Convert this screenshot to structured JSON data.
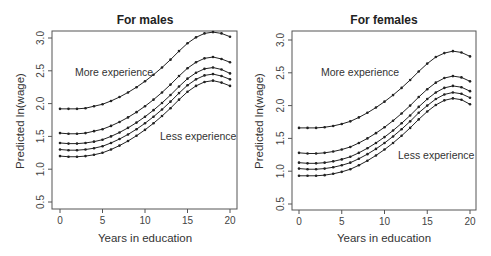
{
  "chart_data": [
    {
      "type": "line",
      "title": "For males",
      "xlabel": "Years in education",
      "ylabel": "Predicted ln(wage)",
      "xlim": [
        0,
        20
      ],
      "ylim": [
        0.5,
        3.0
      ],
      "xticks": [
        0,
        5,
        10,
        15,
        20
      ],
      "yticks": [
        0.5,
        1.0,
        1.5,
        2.0,
        2.5,
        3.0
      ],
      "grid": false,
      "x": [
        0,
        1,
        2,
        3,
        4,
        5,
        6,
        7,
        8,
        9,
        10,
        11,
        12,
        13,
        14,
        15,
        16,
        17,
        18,
        19,
        20
      ],
      "annotations": [
        {
          "text": "More experience",
          "x": 9,
          "y": 2.5
        },
        {
          "text": "Less experience",
          "x": 16.5,
          "y": 1.6
        }
      ],
      "series": [
        {
          "name": "Experience level 1 (most)",
          "values": [
            1.92,
            1.92,
            1.92,
            1.93,
            1.96,
            1.99,
            2.04,
            2.1,
            2.17,
            2.25,
            2.34,
            2.44,
            2.55,
            2.67,
            2.8,
            2.92,
            3.01,
            3.07,
            3.09,
            3.07,
            3.02
          ]
        },
        {
          "name": "Experience level 2",
          "values": [
            1.55,
            1.54,
            1.54,
            1.55,
            1.58,
            1.61,
            1.66,
            1.72,
            1.79,
            1.87,
            1.96,
            2.06,
            2.17,
            2.29,
            2.42,
            2.54,
            2.63,
            2.69,
            2.71,
            2.68,
            2.63
          ]
        },
        {
          "name": "Experience level 3",
          "values": [
            1.4,
            1.39,
            1.39,
            1.4,
            1.42,
            1.45,
            1.5,
            1.56,
            1.63,
            1.71,
            1.8,
            1.9,
            2.01,
            2.13,
            2.26,
            2.38,
            2.47,
            2.53,
            2.55,
            2.52,
            2.46
          ]
        },
        {
          "name": "Experience level 4",
          "values": [
            1.3,
            1.29,
            1.29,
            1.3,
            1.32,
            1.35,
            1.4,
            1.46,
            1.53,
            1.61,
            1.7,
            1.8,
            1.91,
            2.03,
            2.16,
            2.28,
            2.37,
            2.43,
            2.45,
            2.42,
            2.37
          ]
        },
        {
          "name": "Experience level 5 (least)",
          "values": [
            1.2,
            1.19,
            1.19,
            1.2,
            1.22,
            1.25,
            1.3,
            1.36,
            1.43,
            1.51,
            1.6,
            1.7,
            1.81,
            1.93,
            2.06,
            2.18,
            2.27,
            2.33,
            2.35,
            2.32,
            2.27
          ]
        }
      ]
    },
    {
      "type": "line",
      "title": "For females",
      "xlabel": "Years in education",
      "ylabel": "Predicted ln(wage)",
      "xlim": [
        0,
        20
      ],
      "ylim": [
        0.5,
        3.0
      ],
      "xticks": [
        0,
        5,
        10,
        15,
        20
      ],
      "yticks": [
        0.5,
        1.0,
        1.5,
        2.0,
        2.5,
        3.0
      ],
      "grid": false,
      "x": [
        0,
        1,
        2,
        3,
        4,
        5,
        6,
        7,
        8,
        9,
        10,
        11,
        12,
        13,
        14,
        15,
        16,
        17,
        18,
        19,
        20
      ],
      "annotations": [
        {
          "text": "More experience",
          "x": 9,
          "y": 2.5
        },
        {
          "text": "Less experience",
          "x": 16.5,
          "y": 1.2
        }
      ],
      "series": [
        {
          "name": "Experience level 1 (most)",
          "values": [
            1.66,
            1.66,
            1.66,
            1.67,
            1.69,
            1.72,
            1.76,
            1.82,
            1.89,
            1.97,
            2.06,
            2.16,
            2.27,
            2.39,
            2.52,
            2.64,
            2.74,
            2.8,
            2.83,
            2.81,
            2.75
          ]
        },
        {
          "name": "Experience level 2",
          "values": [
            1.28,
            1.27,
            1.27,
            1.28,
            1.3,
            1.33,
            1.37,
            1.43,
            1.5,
            1.58,
            1.67,
            1.77,
            1.88,
            2.0,
            2.13,
            2.25,
            2.35,
            2.42,
            2.45,
            2.43,
            2.37
          ]
        },
        {
          "name": "Experience level 3",
          "values": [
            1.13,
            1.12,
            1.12,
            1.13,
            1.15,
            1.18,
            1.22,
            1.28,
            1.35,
            1.43,
            1.52,
            1.62,
            1.73,
            1.85,
            1.98,
            2.1,
            2.2,
            2.27,
            2.3,
            2.28,
            2.22
          ]
        },
        {
          "name": "Experience level 4",
          "values": [
            1.04,
            1.03,
            1.03,
            1.04,
            1.06,
            1.09,
            1.13,
            1.19,
            1.26,
            1.34,
            1.43,
            1.53,
            1.64,
            1.76,
            1.89,
            2.0,
            2.1,
            2.17,
            2.2,
            2.18,
            2.12
          ]
        },
        {
          "name": "Experience level 5 (least)",
          "values": [
            0.93,
            0.93,
            0.93,
            0.94,
            0.96,
            0.99,
            1.03,
            1.09,
            1.16,
            1.24,
            1.33,
            1.43,
            1.54,
            1.66,
            1.79,
            1.91,
            2.01,
            2.08,
            2.11,
            2.09,
            2.02
          ]
        }
      ]
    }
  ],
  "panels": [
    {
      "title": "For males",
      "ylabel": "Predicted ln(wage)",
      "xlabel": "Years in education",
      "anno_more": "More experience",
      "anno_less": "Less experience"
    },
    {
      "title": "For females",
      "ylabel": "Predicted ln(wage)",
      "xlabel": "Years in education",
      "anno_more": "More experience",
      "anno_less": "Less experience"
    }
  ]
}
